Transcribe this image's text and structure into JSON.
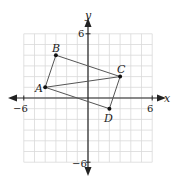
{
  "figure": {
    "axes": {
      "x_label": "x",
      "y_label": "y",
      "x_range": [
        -6,
        6
      ],
      "y_range": [
        -6,
        6
      ],
      "tick_labels": {
        "x_min": "−6",
        "x_max": "6",
        "y_min": "−6",
        "y_max": "6"
      }
    },
    "points": [
      {
        "label": "A",
        "x": -4,
        "y": 1
      },
      {
        "label": "B",
        "x": -3,
        "y": 4
      },
      {
        "label": "C",
        "x": 3,
        "y": 2
      },
      {
        "label": "D",
        "x": 2,
        "y": -1
      }
    ],
    "segments": [
      [
        "A",
        "B"
      ],
      [
        "B",
        "C"
      ],
      [
        "C",
        "A"
      ],
      [
        "A",
        "D"
      ],
      [
        "D",
        "C"
      ]
    ],
    "colors": {
      "grid": "#d9d9d9",
      "axis": "#222222",
      "segment": "#555555",
      "point": "#111111"
    }
  }
}
